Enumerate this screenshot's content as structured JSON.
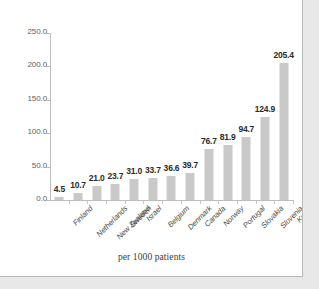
{
  "chart_data": {
    "type": "bar",
    "title": "",
    "subtitle": "",
    "xlabel": "per 1000 patients",
    "ylabel": "",
    "ylim": [
      0,
      250
    ],
    "ytick_labels": [
      "0.0",
      "50.0",
      "100.0",
      "150.0",
      "200.0",
      "250.0"
    ],
    "ytick_values": [
      0,
      50,
      100,
      150,
      200,
      250
    ],
    "grid": false,
    "legend": false,
    "bar_color": "#c9c9c9",
    "categories": [
      "Finland",
      "Netherlands",
      "New Zealand",
      "Sweden",
      "Israel",
      "Belgium",
      "Denmark",
      "Canada",
      "Norway",
      "Portugal",
      "Slovakia",
      "Slovenia",
      "Korea"
    ],
    "values": [
      4.5,
      10.7,
      21.0,
      23.7,
      31.0,
      33.7,
      36.6,
      39.7,
      76.7,
      81.9,
      94.7,
      124.9,
      205.4
    ],
    "value_labels": [
      "4.5",
      "10.7",
      "21.0",
      "23.7",
      "31.0",
      "33.7",
      "36.6",
      "39.7",
      "76.7",
      "81.9",
      "94.7",
      "124.9",
      "205.4"
    ]
  }
}
